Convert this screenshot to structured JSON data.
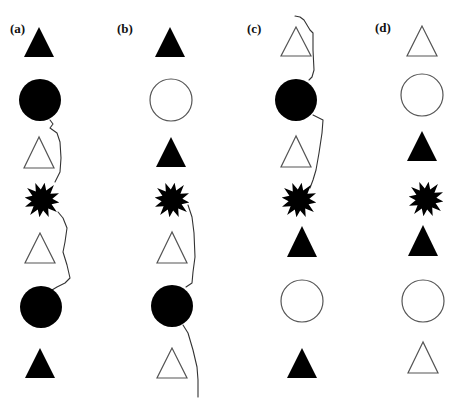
{
  "figure": {
    "background": "#ffffff",
    "colors": {
      "filled": "#000000",
      "outline": "#555555",
      "line": "#333333"
    }
  },
  "panels": [
    {
      "id": "a",
      "label": "(a)",
      "label_pos": [
        10,
        33
      ],
      "shapes": [
        {
          "type": "triangle",
          "fill": "filled",
          "cx": 39,
          "top": 27,
          "bottom": 57,
          "hw": 15
        },
        {
          "type": "circle",
          "fill": "filled",
          "cx": 40,
          "cy": 100,
          "r": 21
        },
        {
          "type": "triangle",
          "fill": "open",
          "cx": 39,
          "top": 137,
          "bottom": 168,
          "hw": 15
        },
        {
          "type": "star",
          "fill": "filled",
          "cx": 42,
          "cy": 200,
          "r": 19
        },
        {
          "type": "triangle",
          "fill": "open",
          "cx": 40,
          "top": 233,
          "bottom": 263,
          "hw": 15
        },
        {
          "type": "circle",
          "fill": "filled",
          "cx": 41,
          "cy": 307,
          "r": 21
        },
        {
          "type": "triangle",
          "fill": "filled",
          "cx": 40,
          "top": 348,
          "bottom": 378,
          "hw": 15
        }
      ],
      "paths": [
        [
          [
            50,
            120
          ],
          [
            53,
            124
          ],
          [
            50,
            128
          ],
          [
            57,
            133
          ],
          [
            60,
            142
          ],
          [
            61,
            158
          ],
          [
            60,
            172
          ],
          [
            55,
            182
          ]
        ],
        [
          [
            58,
            212
          ],
          [
            63,
            218
          ],
          [
            67,
            228
          ],
          [
            65,
            242
          ],
          [
            63,
            252
          ],
          [
            67,
            265
          ],
          [
            70,
            278
          ],
          [
            65,
            283
          ],
          [
            57,
            287
          ],
          [
            52,
            290
          ]
        ]
      ]
    },
    {
      "id": "b",
      "label": "(b)",
      "label_pos": [
        117,
        33
      ],
      "shapes": [
        {
          "type": "triangle",
          "fill": "filled",
          "cx": 170,
          "top": 27,
          "bottom": 57,
          "hw": 15
        },
        {
          "type": "circle",
          "fill": "open",
          "cx": 171,
          "cy": 100,
          "r": 21
        },
        {
          "type": "triangle",
          "fill": "filled",
          "cx": 171,
          "top": 137,
          "bottom": 167,
          "hw": 15
        },
        {
          "type": "star",
          "fill": "filled",
          "cx": 172,
          "cy": 200,
          "r": 19
        },
        {
          "type": "triangle",
          "fill": "open",
          "cx": 172,
          "top": 232,
          "bottom": 263,
          "hw": 15
        },
        {
          "type": "circle",
          "fill": "filled",
          "cx": 172,
          "cy": 306,
          "r": 21
        },
        {
          "type": "triangle",
          "fill": "open",
          "cx": 172,
          "top": 348,
          "bottom": 378,
          "hw": 15
        }
      ],
      "paths": [
        [
          [
            188,
            205
          ],
          [
            192,
            217
          ],
          [
            194,
            233
          ],
          [
            195,
            257
          ],
          [
            193,
            272
          ],
          [
            192,
            283
          ],
          [
            186,
            287
          ]
        ],
        [
          [
            183,
            325
          ],
          [
            188,
            333
          ],
          [
            193,
            350
          ],
          [
            197,
            367
          ],
          [
            198,
            380
          ],
          [
            198,
            397
          ]
        ]
      ]
    },
    {
      "id": "c",
      "label": "(c)",
      "label_pos": [
        247,
        33
      ],
      "shapes": [
        {
          "type": "triangle",
          "fill": "open",
          "cx": 296,
          "top": 27,
          "bottom": 56,
          "hw": 15
        },
        {
          "type": "circle",
          "fill": "filled",
          "cx": 296,
          "cy": 100,
          "r": 21
        },
        {
          "type": "triangle",
          "fill": "open",
          "cx": 296,
          "top": 136,
          "bottom": 167,
          "hw": 15
        },
        {
          "type": "star",
          "fill": "filled",
          "cx": 299,
          "cy": 200,
          "r": 19
        },
        {
          "type": "triangle",
          "fill": "filled",
          "cx": 302,
          "top": 226,
          "bottom": 257,
          "hw": 15
        },
        {
          "type": "circle",
          "fill": "open",
          "cx": 302,
          "cy": 301,
          "r": 21
        },
        {
          "type": "triangle",
          "fill": "filled",
          "cx": 302,
          "top": 348,
          "bottom": 378,
          "hw": 15
        }
      ],
      "paths": [
        [
          [
            295,
            16
          ],
          [
            300,
            17
          ],
          [
            304,
            20
          ],
          [
            307,
            25
          ],
          [
            310,
            30
          ],
          [
            313,
            33
          ],
          [
            313,
            50
          ],
          [
            314,
            70
          ],
          [
            312,
            77
          ],
          [
            309,
            80
          ]
        ],
        [
          [
            313,
            115
          ],
          [
            323,
            120
          ],
          [
            322,
            133
          ],
          [
            319,
            153
          ],
          [
            316,
            170
          ],
          [
            313,
            180
          ],
          [
            310,
            188
          ]
        ]
      ]
    },
    {
      "id": "d",
      "label": "(d)",
      "label_pos": [
        375,
        32
      ],
      "shapes": [
        {
          "type": "triangle",
          "fill": "open",
          "cx": 422,
          "top": 26,
          "bottom": 56,
          "hw": 15
        },
        {
          "type": "circle",
          "fill": "open",
          "cx": 422,
          "cy": 95,
          "r": 21
        },
        {
          "type": "triangle",
          "fill": "filled",
          "cx": 422,
          "top": 131,
          "bottom": 161,
          "hw": 15
        },
        {
          "type": "star",
          "fill": "filled",
          "cx": 426,
          "cy": 199,
          "r": 19
        },
        {
          "type": "triangle",
          "fill": "filled",
          "cx": 423,
          "top": 225,
          "bottom": 256,
          "hw": 15
        },
        {
          "type": "circle",
          "fill": "open",
          "cx": 423,
          "cy": 301,
          "r": 21
        },
        {
          "type": "triangle",
          "fill": "open",
          "cx": 423,
          "top": 342,
          "bottom": 373,
          "hw": 15
        }
      ],
      "paths": []
    }
  ]
}
